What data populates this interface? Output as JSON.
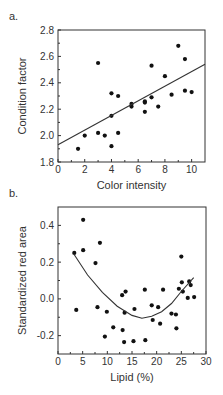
{
  "panels": [
    {
      "label": "a."
    },
    {
      "label": "b."
    }
  ],
  "chart_data": [
    {
      "type": "scatter",
      "title": "",
      "panel_label": "a.",
      "xlabel": "Color intensity",
      "ylabel": "Condition factor",
      "xlim": [
        0,
        11
      ],
      "ylim": [
        1.8,
        2.8
      ],
      "xticks": [
        0,
        2,
        4,
        6,
        8,
        10
      ],
      "xtick_labels": [
        "0",
        "2",
        "4",
        "6",
        "8",
        "10"
      ],
      "yticks": [
        1.8,
        2.0,
        2.2,
        2.4,
        2.6,
        2.8
      ],
      "ytick_labels": [
        "1.8",
        "2.0",
        "2.2",
        "2.4",
        "2.6",
        "2.8"
      ],
      "grid": false,
      "legend": null,
      "series": [
        {
          "name": "observations",
          "points": [
            [
              1.5,
              1.9
            ],
            [
              2.0,
              2.0
            ],
            [
              3.0,
              2.55
            ],
            [
              3.0,
              2.02
            ],
            [
              3.5,
              2.0
            ],
            [
              4.0,
              2.32
            ],
            [
              4.0,
              2.15
            ],
            [
              4.0,
              1.92
            ],
            [
              4.5,
              2.3
            ],
            [
              4.5,
              2.02
            ],
            [
              5.5,
              2.24
            ],
            [
              5.5,
              2.22
            ],
            [
              6.5,
              2.25
            ],
            [
              6.5,
              2.26
            ],
            [
              6.5,
              2.18
            ],
            [
              7.0,
              2.53
            ],
            [
              7.0,
              2.29
            ],
            [
              7.5,
              2.22
            ],
            [
              8.0,
              2.45
            ],
            [
              8.5,
              2.31
            ],
            [
              9.0,
              2.68
            ],
            [
              9.5,
              2.58
            ],
            [
              9.5,
              2.34
            ],
            [
              10.0,
              2.33
            ]
          ]
        },
        {
          "name": "linear fit",
          "type": "line",
          "points": [
            [
              0,
              1.93
            ],
            [
              11,
              2.54
            ]
          ]
        }
      ]
    },
    {
      "type": "scatter",
      "title": "",
      "panel_label": "b.",
      "xlabel": "Lipid (%)",
      "ylabel": "Standardized red area",
      "xlim": [
        0,
        30
      ],
      "ylim": [
        -0.3,
        0.5
      ],
      "xticks": [
        0,
        5,
        10,
        15,
        20,
        25,
        30
      ],
      "xtick_labels": [
        "0",
        "5",
        "10",
        "15",
        "20",
        "25",
        "30"
      ],
      "yticks": [
        -0.2,
        0.0,
        0.2,
        0.4
      ],
      "ytick_labels": [
        "-0.2",
        "0.0",
        "0.2",
        "0.4"
      ],
      "grid": false,
      "legend": null,
      "series": [
        {
          "name": "observations",
          "points": [
            [
              3.3,
              0.25
            ],
            [
              3.7,
              -0.06
            ],
            [
              5.1,
              0.43
            ],
            [
              5.1,
              0.265
            ],
            [
              7.6,
              0.195
            ],
            [
              8.0,
              -0.045
            ],
            [
              8.5,
              0.305
            ],
            [
              9.5,
              -0.205
            ],
            [
              9.9,
              -0.07
            ],
            [
              11.2,
              -0.155
            ],
            [
              13.0,
              0.02
            ],
            [
              13.1,
              -0.17
            ],
            [
              13.4,
              -0.235
            ],
            [
              13.5,
              -0.075
            ],
            [
              13.7,
              0.04
            ],
            [
              15.3,
              -0.23
            ],
            [
              15.5,
              -0.055
            ],
            [
              17.6,
              0.05
            ],
            [
              17.7,
              -0.225
            ],
            [
              19.0,
              -0.035
            ],
            [
              19.2,
              -0.115
            ],
            [
              20.3,
              -0.045
            ],
            [
              20.7,
              -0.135
            ],
            [
              21.3,
              0.05
            ],
            [
              23.0,
              -0.08
            ],
            [
              23.9,
              -0.085
            ],
            [
              24.0,
              -0.16
            ],
            [
              24.5,
              0.055
            ],
            [
              25.0,
              0.23
            ],
            [
              25.1,
              0.09
            ],
            [
              25.3,
              0.04
            ],
            [
              26.3,
              0.005
            ],
            [
              26.6,
              0.095
            ],
            [
              26.9,
              0.075
            ],
            [
              27.6,
              0.01
            ]
          ]
        },
        {
          "name": "quadratic fit",
          "type": "line",
          "points": [
            [
              3.3,
              0.24
            ],
            [
              6,
              0.13
            ],
            [
              9,
              0.035
            ],
            [
              12,
              -0.04
            ],
            [
              15,
              -0.09
            ],
            [
              17,
              -0.105
            ],
            [
              19,
              -0.095
            ],
            [
              21,
              -0.07
            ],
            [
              23,
              -0.025
            ],
            [
              25,
              0.04
            ],
            [
              27.5,
              0.115
            ]
          ]
        }
      ]
    }
  ]
}
